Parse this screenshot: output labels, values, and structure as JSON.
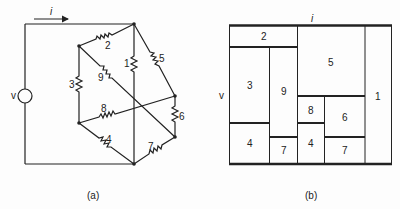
{
  "figure_a": {
    "caption": "(a)",
    "current_label": "i",
    "source_label": "v",
    "resistors": [
      {
        "id": "r1",
        "label": "1"
      },
      {
        "id": "r2",
        "label": "2"
      },
      {
        "id": "r3",
        "label": "3"
      },
      {
        "id": "r4",
        "label": "4"
      },
      {
        "id": "r5",
        "label": "5"
      },
      {
        "id": "r6",
        "label": "6"
      },
      {
        "id": "r7",
        "label": "7"
      },
      {
        "id": "r8",
        "label": "8"
      },
      {
        "id": "r9",
        "label": "9"
      }
    ]
  },
  "figure_b": {
    "caption": "(b)",
    "current_label": "i",
    "voltage_label": "v",
    "cells": [
      {
        "label": "2"
      },
      {
        "label": "3"
      },
      {
        "label": "9"
      },
      {
        "label": "5"
      },
      {
        "label": "8"
      },
      {
        "label": "6"
      },
      {
        "label": "4"
      },
      {
        "label": "7"
      },
      {
        "label": "4"
      },
      {
        "label": "7"
      },
      {
        "label": "1"
      }
    ]
  }
}
